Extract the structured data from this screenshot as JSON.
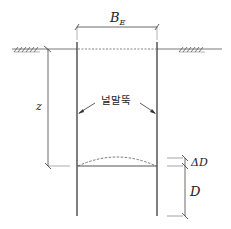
{
  "diagram": {
    "labels": {
      "width": "B",
      "width_subscript": "E",
      "depth_z": "z",
      "sheet_pile": "널말뚝",
      "delta_d": "ΔD",
      "embedment_d": "D"
    },
    "colors": {
      "line": "#2a2a2a",
      "dim_line": "#444444",
      "dashed": "#555555",
      "background": "#ffffff"
    }
  }
}
